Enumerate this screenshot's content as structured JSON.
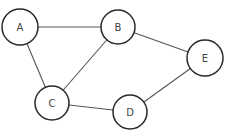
{
  "graph": {
    "type": "undirected",
    "nodes": [
      {
        "id": "A",
        "label": "A",
        "x": 20,
        "y": 27,
        "r": 18
      },
      {
        "id": "B",
        "label": "B",
        "x": 118,
        "y": 27,
        "r": 17
      },
      {
        "id": "C",
        "label": "C",
        "x": 52,
        "y": 103,
        "r": 17
      },
      {
        "id": "D",
        "label": "D",
        "x": 130,
        "y": 112,
        "r": 17
      },
      {
        "id": "E",
        "label": "E",
        "x": 205,
        "y": 58,
        "r": 18
      }
    ],
    "edges": [
      {
        "from": "A",
        "to": "B"
      },
      {
        "from": "A",
        "to": "C"
      },
      {
        "from": "B",
        "to": "C"
      },
      {
        "from": "B",
        "to": "E"
      },
      {
        "from": "C",
        "to": "D"
      },
      {
        "from": "D",
        "to": "E"
      }
    ]
  },
  "colors": {
    "node_stroke": "#2a2a2a",
    "edge_stroke": "#555555",
    "label": "#444444",
    "background": "#ffffff"
  }
}
